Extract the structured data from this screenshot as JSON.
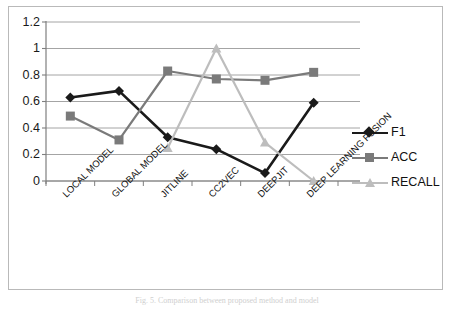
{
  "chart_data": {
    "type": "line",
    "title": "",
    "xlabel": "",
    "ylabel": "",
    "ylim": [
      0,
      1.2
    ],
    "grid": true,
    "legend_position": "right",
    "categories": [
      "LOCAL MODEL",
      "GLOBAL MODEL",
      "JITLINE",
      "CC2VEC",
      "DEEPJIT",
      "DEEP LEARNING FUSION"
    ],
    "ytick_labels": [
      "0",
      "0.2",
      "0.4",
      "0.6",
      "0.8",
      "1",
      "1.2"
    ],
    "ytick_values": [
      0,
      0.2,
      0.4,
      0.6,
      0.8,
      1,
      1.2
    ],
    "series": [
      {
        "name": "F1",
        "color": "#1a1a1a",
        "marker": "diamond",
        "values": [
          0.63,
          0.68,
          0.33,
          0.24,
          0.06,
          0.59
        ]
      },
      {
        "name": "ACC",
        "color": "#7a7a7a",
        "marker": "square",
        "values": [
          0.49,
          0.31,
          0.83,
          0.77,
          0.76,
          0.82
        ]
      },
      {
        "name": "RECALL",
        "color": "#bdbdbd",
        "marker": "triangle",
        "values": [
          null,
          null,
          0.25,
          1.0,
          0.29,
          0.0
        ]
      }
    ]
  },
  "legend": {
    "items": [
      {
        "label": "F1",
        "color": "#1a1a1a",
        "marker": "diamond"
      },
      {
        "label": "ACC",
        "color": "#7a7a7a",
        "marker": "square"
      },
      {
        "label": "RECALL",
        "color": "#bdbdbd",
        "marker": "triangle"
      }
    ]
  },
  "caption": {
    "text": "Fig. 5.  Comparison between proposed method and model"
  },
  "colors": {
    "frame": "#b9b9b9",
    "gridline": "#9a9a9a",
    "axis": "#7f7f7f",
    "background": "#ffffff",
    "text": "#111111"
  }
}
